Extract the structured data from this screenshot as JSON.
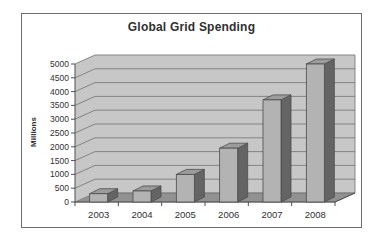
{
  "figure": {
    "background": "#ffffff",
    "frame": {
      "border_color": "#6e6e6e",
      "fill": "#ffffff"
    }
  },
  "chart_data": {
    "type": "bar",
    "projection": "3d",
    "title": "Global Grid Spending",
    "xlabel": "",
    "ylabel": "Millions",
    "categories": [
      "2003",
      "2004",
      "2005",
      "2006",
      "2007",
      "2008"
    ],
    "values": [
      300,
      400,
      1000,
      1950,
      3700,
      5000
    ],
    "ylim": [
      0,
      5000
    ],
    "ytick_step": 500,
    "ytick_labels": [
      "0",
      "500",
      "1000",
      "1500",
      "2000",
      "2500",
      "3000",
      "3500",
      "4000",
      "4500",
      "5000"
    ],
    "grid": true,
    "legend_position": "none",
    "colors": {
      "bar_front": "#b3b3b3",
      "bar_top": "#9c9c9c",
      "bar_side": "#646464",
      "bar_outline": "#4c4c4c",
      "wall": "#c7c7c7",
      "floor": "#919191",
      "gridline": "#7c7c7c",
      "axis": "#4f4f4f",
      "text": "#303030"
    }
  }
}
